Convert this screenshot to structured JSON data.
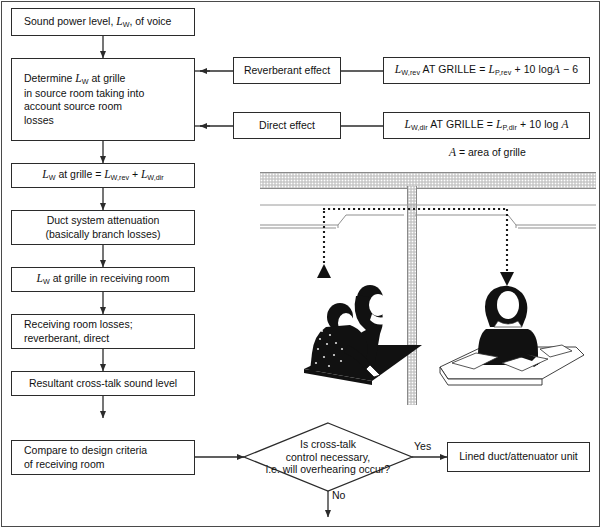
{
  "diagram": {
    "type": "flowchart"
  },
  "flow": {
    "boxes": [
      {
        "id": "b1",
        "label": "Sound power level, LW, of voice"
      },
      {
        "id": "b2",
        "label": "Determine LW at grille in source room taking into account source room losses"
      },
      {
        "id": "b3",
        "label": "LW at grille = LW,rev + LW,dir"
      },
      {
        "id": "b4",
        "label": "Duct system attenuation (basically branch losses)"
      },
      {
        "id": "b5",
        "label": "LW at grille in receiving room"
      },
      {
        "id": "b6",
        "label": "Receiving room losses: reverberant, direct"
      },
      {
        "id": "b7",
        "label": "Resultant cross-talk sound level"
      },
      {
        "id": "b8",
        "label": "Compare to design criteria of receiving room"
      }
    ],
    "effects": [
      {
        "id": "e1",
        "label": "Reverberant effect"
      },
      {
        "id": "e2",
        "label": "Direct effect"
      }
    ],
    "equations": [
      {
        "id": "eq1",
        "label": "LW,rev AT GRILLE = LP,rev + 10 logA − 6"
      },
      {
        "id": "eq2",
        "label": "LW,dir AT GRILLE = LP,dir + 10 log A"
      }
    ],
    "note": "A = area of grille",
    "decision": {
      "label": "Is cross-talk control necessary, i.e. will overhearing occur?"
    },
    "branch_yes": "Yes",
    "branch_no": "No",
    "outcome": {
      "label": "Lined duct/attenuator unit"
    }
  },
  "illustration": {
    "caption": "Cross-talk via ceiling duct crossing a partition",
    "parts": [
      {
        "name": "ceiling-slab"
      },
      {
        "name": "partition-wall"
      },
      {
        "name": "duct"
      },
      {
        "name": "source-grille"
      },
      {
        "name": "receiving-grille"
      },
      {
        "name": "sound-path"
      },
      {
        "name": "talkers"
      },
      {
        "name": "listener"
      }
    ]
  },
  "colors": {
    "line": "#2b2b2b",
    "frame": "#4a4a4a",
    "hatch": "#d8d8d8",
    "ink": "#111111",
    "paper": "#ffffff"
  }
}
